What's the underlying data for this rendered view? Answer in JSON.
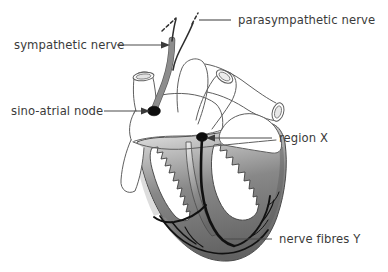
{
  "figure": {
    "type": "biological-diagram",
    "background_color": "#ffffff",
    "width": 388,
    "height": 272
  },
  "labels": [
    {
      "id": "parasympathetic-nerve",
      "text": "parasympathetic nerve",
      "position": "top-right",
      "text_x": 238,
      "text_y": 24,
      "anchor": "start",
      "leader": {
        "x1": 231,
        "y1": 20,
        "x2": 196,
        "y2": 20
      },
      "pointer": "dashed-arrow-to-nerve"
    },
    {
      "id": "sympathetic-nerve",
      "text": "sympathetic nerve",
      "position": "upper-left",
      "text_x": 14,
      "text_y": 49,
      "anchor": "start",
      "leader": {
        "x1": 117,
        "y1": 45,
        "x2": 166,
        "y2": 45
      },
      "pointer": "arrow-right"
    },
    {
      "id": "sino-atrial-node",
      "text": "sino-atrial node",
      "position": "left",
      "text_x": 11,
      "text_y": 115,
      "anchor": "start",
      "leader": {
        "x1": 104,
        "y1": 111,
        "x2": 146,
        "y2": 111
      },
      "pointer": "arrow-right"
    },
    {
      "id": "region-x",
      "text": "region X",
      "position": "right",
      "text_x": 279,
      "text_y": 142,
      "anchor": "start",
      "leader": {
        "x1": 272,
        "y1": 138,
        "x2": 208,
        "y2": 138
      },
      "pointer": "arrow-left"
    },
    {
      "id": "nerve-fibres-y",
      "text": "nerve fibres Y",
      "position": "bottom-right",
      "text_x": 279,
      "text_y": 243,
      "anchor": "start",
      "leader": {
        "x1": 272,
        "y1": 239,
        "x2": 224,
        "y2": 239
      },
      "pointer": "plain-line"
    }
  ],
  "anatomy": {
    "structures": [
      "superior vena cava",
      "aorta",
      "pulmonary artery",
      "pulmonary vein",
      "right atrium",
      "left atrium",
      "right ventricle",
      "left ventricle",
      "interventricular septum",
      "inferior vena cava"
    ],
    "markers": [
      {
        "name": "sino-atrial node",
        "shape": "filled-oval",
        "cx": 154,
        "cy": 111,
        "rx": 6.2,
        "ry": 4.6
      },
      {
        "name": "region X node",
        "shape": "filled-oval",
        "cx": 202,
        "cy": 137,
        "rx": 5.4,
        "ry": 4.2
      }
    ]
  },
  "colors": {
    "outline": "#5f5f5f",
    "text": "#3a3a3a",
    "leader_line": "#4a4a4a",
    "nerve_trunk_gray": "#8d8d8d",
    "nerve_fibre_black": "#111111",
    "ventricle_wall_dark": "#6b6b6b",
    "ventricle_wall_light": "#d8d8d8",
    "background": "#ffffff"
  },
  "legend_note": {
    "sympathetic_pathway": "gray trunk descending to sino-atrial node",
    "parasympathetic_pathway": "dashed line entering at top",
    "conduction_pathway": "black fibres from region X through septum to apex and ventricle walls"
  }
}
